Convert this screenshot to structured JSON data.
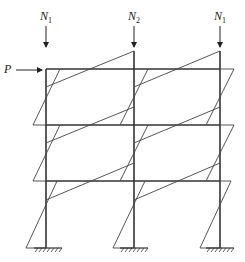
{
  "diagram": {
    "loads": {
      "lateral": {
        "label": "P"
      },
      "axial": [
        {
          "label": "N",
          "sub": "1"
        },
        {
          "label": "N",
          "sub": "2"
        },
        {
          "label": "N",
          "sub": "1"
        }
      ]
    },
    "structure": {
      "stories": 3,
      "bays": 2,
      "supports": "fixed"
    },
    "colors": {
      "line": "#333333",
      "background": "#ffffff"
    }
  }
}
